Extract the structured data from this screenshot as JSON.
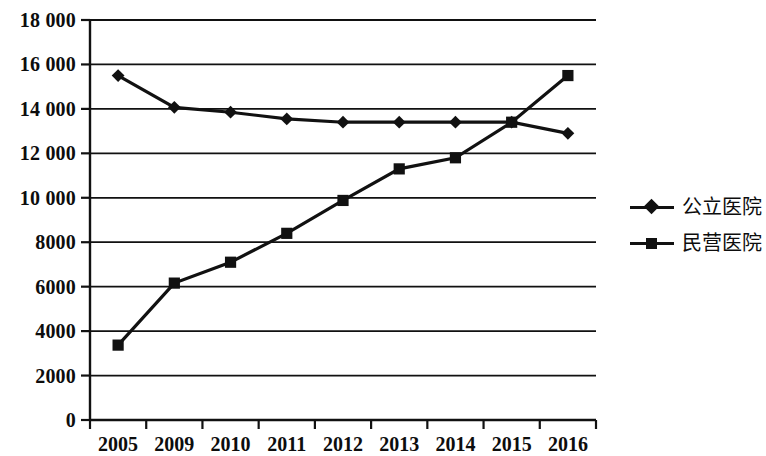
{
  "chart_data": {
    "type": "line",
    "title": "",
    "subtitle": "",
    "xlabel": "",
    "ylabel": "",
    "categories": [
      "2005",
      "2009",
      "2010",
      "2011",
      "2012",
      "2013",
      "2014",
      "2015",
      "2016"
    ],
    "series": [
      {
        "name": "公立医院",
        "marker": "diamond",
        "color": "#111111",
        "values": [
          15500,
          14070,
          13850,
          13550,
          13400,
          13400,
          13400,
          13400,
          12900
        ]
      },
      {
        "name": "民营医院",
        "marker": "square",
        "color": "#111111",
        "values": [
          3370,
          6160,
          7100,
          8400,
          9880,
          11300,
          11800,
          13400,
          15500
        ]
      }
    ],
    "ylim": [
      0,
      18000
    ],
    "ytick_values": [
      0,
      2000,
      4000,
      6000,
      8000,
      10000,
      12000,
      14000,
      16000,
      18000
    ],
    "ytick_labels": [
      "0",
      "2000",
      "4000",
      "6000",
      "8000",
      "10 000",
      "12 000",
      "14 000",
      "16 000",
      "18 000"
    ],
    "grid": true,
    "grid_axis": "y",
    "legend_position": "right"
  },
  "legend": {
    "entries": [
      {
        "label": "公立医院",
        "marker": "diamond"
      },
      {
        "label": "民营医院",
        "marker": "square"
      }
    ]
  }
}
